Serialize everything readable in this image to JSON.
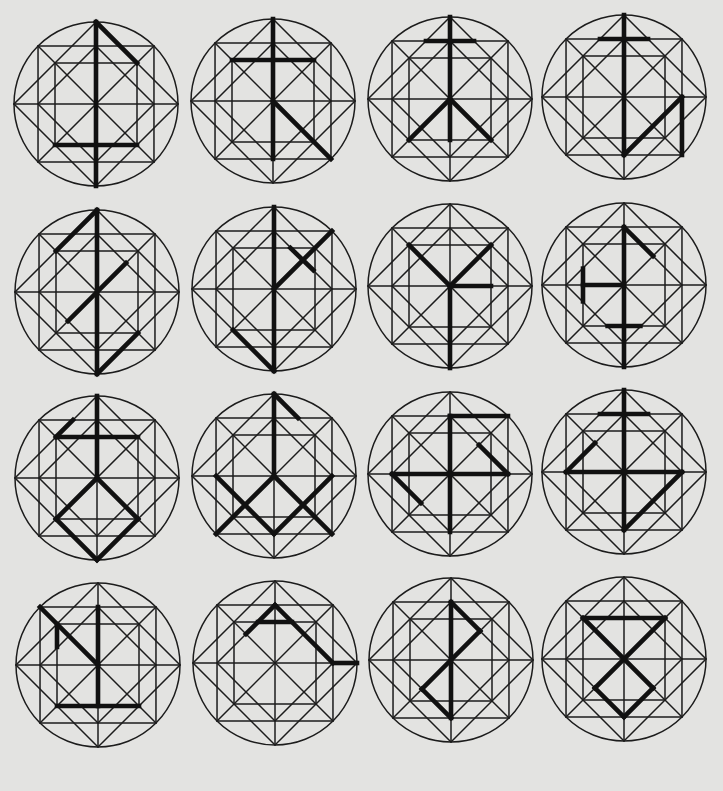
{
  "diagram": {
    "colors": {
      "background": "#e3e3e1",
      "lattice": "#1c1c1c",
      "glyph": "#111111"
    },
    "radius": 82,
    "lattice_points": {
      "C": 0.707,
      "I": 0.5,
      "S": 0.354
    },
    "symbols": [
      {
        "id": 1,
        "row": 1,
        "col": 1,
        "cx": 96,
        "cy": 104,
        "strokes": [
          [
            [
              0,
              -1
            ],
            [
              0,
              1
            ]
          ],
          [
            [
              0,
              -1
            ],
            [
              0.5,
              -0.5
            ]
          ],
          [
            [
              -0.5,
              0.5
            ],
            [
              0.5,
              0.5
            ]
          ]
        ]
      },
      {
        "id": 2,
        "row": 1,
        "col": 2,
        "cx": 273,
        "cy": 101,
        "strokes": [
          [
            [
              0,
              -1
            ],
            [
              0,
              0.707
            ]
          ],
          [
            [
              -0.5,
              -0.5
            ],
            [
              0.5,
              -0.5
            ]
          ],
          [
            [
              0,
              0
            ],
            [
              0.707,
              0.707
            ]
          ]
        ]
      },
      {
        "id": 3,
        "row": 1,
        "col": 3,
        "cx": 450,
        "cy": 99,
        "strokes": [
          [
            [
              0,
              -1
            ],
            [
              0,
              0.5
            ]
          ],
          [
            [
              -0.293,
              -0.707
            ],
            [
              0.293,
              -0.707
            ]
          ],
          [
            [
              0,
              0
            ],
            [
              -0.5,
              0.5
            ]
          ],
          [
            [
              0,
              0
            ],
            [
              0.5,
              0.5
            ]
          ]
        ]
      },
      {
        "id": 4,
        "row": 1,
        "col": 4,
        "cx": 624,
        "cy": 97,
        "strokes": [
          [
            [
              0,
              -1
            ],
            [
              0,
              0.707
            ]
          ],
          [
            [
              -0.293,
              -0.707
            ],
            [
              0.293,
              -0.707
            ]
          ],
          [
            [
              0,
              0.707
            ],
            [
              0.707,
              0
            ]
          ],
          [
            [
              0.707,
              0
            ],
            [
              0.707,
              0.707
            ]
          ]
        ]
      },
      {
        "id": 5,
        "row": 2,
        "col": 1,
        "cx": 97,
        "cy": 292,
        "strokes": [
          [
            [
              0,
              -1
            ],
            [
              0,
              1
            ]
          ],
          [
            [
              0,
              -1
            ],
            [
              -0.5,
              -0.5
            ]
          ],
          [
            [
              -0.354,
              0.354
            ],
            [
              0.354,
              -0.354
            ]
          ],
          [
            [
              0,
              1
            ],
            [
              0.5,
              0.5
            ]
          ]
        ]
      },
      {
        "id": 6,
        "row": 2,
        "col": 2,
        "cx": 274,
        "cy": 289,
        "strokes": [
          [
            [
              0,
              -1
            ],
            [
              0,
              1
            ]
          ],
          [
            [
              0,
              0
            ],
            [
              0.707,
              -0.707
            ]
          ],
          [
            [
              0.2,
              -0.5
            ],
            [
              0.48,
              -0.23
            ]
          ],
          [
            [
              0,
              1
            ],
            [
              -0.5,
              0.5
            ]
          ]
        ]
      },
      {
        "id": 7,
        "row": 2,
        "col": 3,
        "cx": 450,
        "cy": 286,
        "strokes": [
          [
            [
              -0.5,
              -0.5
            ],
            [
              0,
              0
            ]
          ],
          [
            [
              0.5,
              -0.5
            ],
            [
              0,
              0
            ]
          ],
          [
            [
              0,
              0
            ],
            [
              0,
              1
            ]
          ],
          [
            [
              0,
              0
            ],
            [
              0.5,
              0
            ]
          ]
        ]
      },
      {
        "id": 8,
        "row": 2,
        "col": 4,
        "cx": 624,
        "cy": 285,
        "strokes": [
          [
            [
              0,
              -0.707
            ],
            [
              0,
              1
            ]
          ],
          [
            [
              0,
              -0.707
            ],
            [
              0.354,
              -0.354
            ]
          ],
          [
            [
              0,
              0
            ],
            [
              -0.5,
              0
            ]
          ],
          [
            [
              -0.5,
              -0.2
            ],
            [
              -0.5,
              0.2
            ]
          ],
          [
            [
              -0.2,
              0.5
            ],
            [
              0.2,
              0.5
            ]
          ]
        ]
      },
      {
        "id": 9,
        "row": 3,
        "col": 1,
        "cx": 97,
        "cy": 478,
        "strokes": [
          [
            [
              0,
              -1
            ],
            [
              0,
              0
            ]
          ],
          [
            [
              -0.5,
              -0.5
            ],
            [
              0.5,
              -0.5
            ]
          ],
          [
            [
              -0.5,
              -0.5
            ],
            [
              -0.293,
              -0.707
            ]
          ],
          [
            [
              0,
              0
            ],
            [
              -0.5,
              0.5
            ]
          ],
          [
            [
              -0.5,
              0.5
            ],
            [
              0,
              1
            ]
          ],
          [
            [
              0,
              1
            ],
            [
              0.5,
              0.5
            ]
          ],
          [
            [
              0.5,
              0.5
            ],
            [
              0,
              0
            ]
          ]
        ]
      },
      {
        "id": 10,
        "row": 3,
        "col": 2,
        "cx": 274,
        "cy": 476,
        "strokes": [
          [
            [
              0,
              -1
            ],
            [
              0,
              0
            ]
          ],
          [
            [
              0,
              -1
            ],
            [
              0.293,
              -0.707
            ]
          ],
          [
            [
              -0.707,
              0
            ],
            [
              0,
              0.707
            ]
          ],
          [
            [
              0,
              0.707
            ],
            [
              0.707,
              0
            ]
          ],
          [
            [
              0,
              0
            ],
            [
              -0.707,
              0.707
            ]
          ],
          [
            [
              0,
              0
            ],
            [
              0.707,
              0.707
            ]
          ]
        ]
      },
      {
        "id": 11,
        "row": 3,
        "col": 3,
        "cx": 450,
        "cy": 474,
        "strokes": [
          [
            [
              0,
              -0.707
            ],
            [
              0,
              0.707
            ]
          ],
          [
            [
              0,
              -0.707
            ],
            [
              0.707,
              -0.707
            ]
          ],
          [
            [
              -0.707,
              0
            ],
            [
              0.707,
              0
            ]
          ],
          [
            [
              0.707,
              0
            ],
            [
              0.354,
              -0.354
            ]
          ],
          [
            [
              -0.707,
              0
            ],
            [
              -0.354,
              0.354
            ]
          ]
        ]
      },
      {
        "id": 12,
        "row": 3,
        "col": 4,
        "cx": 624,
        "cy": 472,
        "strokes": [
          [
            [
              0,
              -1
            ],
            [
              0,
              0.707
            ]
          ],
          [
            [
              -0.293,
              -0.707
            ],
            [
              0.293,
              -0.707
            ]
          ],
          [
            [
              -0.707,
              0
            ],
            [
              0.707,
              0
            ]
          ],
          [
            [
              -0.707,
              0
            ],
            [
              -0.354,
              -0.354
            ]
          ],
          [
            [
              0.707,
              0
            ],
            [
              0,
              0.707
            ]
          ]
        ]
      },
      {
        "id": 13,
        "row": 4,
        "col": 1,
        "cx": 98,
        "cy": 665,
        "strokes": [
          [
            [
              -0.707,
              -0.707
            ],
            [
              0,
              0
            ]
          ],
          [
            [
              0,
              -0.707
            ],
            [
              0,
              0.5
            ]
          ],
          [
            [
              -0.5,
              0.5
            ],
            [
              0.5,
              0.5
            ]
          ],
          [
            [
              -0.5,
              -0.5
            ],
            [
              -0.5,
              -0.22
            ]
          ]
        ]
      },
      {
        "id": 14,
        "row": 4,
        "col": 2,
        "cx": 275,
        "cy": 663,
        "strokes": [
          [
            [
              -0.354,
              -0.354
            ],
            [
              0,
              -0.707
            ]
          ],
          [
            [
              0,
              -0.707
            ],
            [
              0.707,
              0
            ]
          ],
          [
            [
              0.707,
              0
            ],
            [
              1,
              0
            ]
          ],
          [
            [
              -0.207,
              -0.5
            ],
            [
              0.207,
              -0.5
            ]
          ]
        ]
      },
      {
        "id": 15,
        "row": 4,
        "col": 3,
        "cx": 451,
        "cy": 660,
        "strokes": [
          [
            [
              0,
              -0.707
            ],
            [
              0,
              0.707
            ]
          ],
          [
            [
              0,
              -0.707
            ],
            [
              0.354,
              -0.354
            ]
          ],
          [
            [
              0.354,
              -0.354
            ],
            [
              -0.354,
              0.354
            ]
          ],
          [
            [
              -0.354,
              0.354
            ],
            [
              0,
              0.707
            ]
          ]
        ]
      },
      {
        "id": 16,
        "row": 4,
        "col": 4,
        "cx": 624,
        "cy": 659,
        "strokes": [
          [
            [
              -0.5,
              -0.5
            ],
            [
              0.5,
              -0.5
            ]
          ],
          [
            [
              -0.5,
              -0.5
            ],
            [
              0.354,
              0.354
            ]
          ],
          [
            [
              0.5,
              -0.5
            ],
            [
              -0.354,
              0.354
            ]
          ],
          [
            [
              -0.354,
              0.354
            ],
            [
              0,
              0.707
            ]
          ],
          [
            [
              0,
              0.707
            ],
            [
              0.354,
              0.354
            ]
          ]
        ]
      }
    ]
  }
}
